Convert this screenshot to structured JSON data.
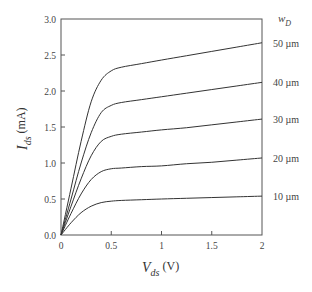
{
  "chart_data": {
    "type": "line",
    "title": "",
    "xlabel": "V_ds (V)",
    "ylabel": "I_ds (mA)",
    "xlabel_main": "V",
    "xlabel_sub": "ds",
    "xlabel_unit": "(V)",
    "ylabel_main": "I",
    "ylabel_sub": "ds",
    "ylabel_unit": "(mA)",
    "xlim": [
      0,
      2
    ],
    "ylim": [
      0,
      3.0
    ],
    "xticks": [
      "0",
      "0.5",
      "1",
      "1.5",
      "2"
    ],
    "yticks": [
      "0.0",
      "0.5",
      "1.0",
      "1.5",
      "2.0",
      "2.5",
      "3.0"
    ],
    "grid": false,
    "legend_title_main": "w",
    "legend_title_sub": "D",
    "legend_position": "right",
    "x": [
      0,
      0.1,
      0.2,
      0.3,
      0.4,
      0.5,
      0.6,
      0.8,
      1.0,
      1.25,
      1.5,
      1.75,
      2.0
    ],
    "series": [
      {
        "name": "10 µm",
        "label": "10 µm",
        "values": [
          0,
          0.17,
          0.31,
          0.4,
          0.45,
          0.47,
          0.48,
          0.49,
          0.5,
          0.51,
          0.52,
          0.53,
          0.54
        ]
      },
      {
        "name": "20 µm",
        "label": "20 µm",
        "values": [
          0,
          0.3,
          0.57,
          0.77,
          0.88,
          0.92,
          0.93,
          0.95,
          0.96,
          0.99,
          1.01,
          1.04,
          1.07
        ]
      },
      {
        "name": "30 µm",
        "label": "30 µm",
        "values": [
          0,
          0.4,
          0.78,
          1.1,
          1.3,
          1.37,
          1.4,
          1.43,
          1.46,
          1.49,
          1.53,
          1.57,
          1.61
        ]
      },
      {
        "name": "40 µm",
        "label": "40 µm",
        "values": [
          0,
          0.5,
          1.0,
          1.42,
          1.7,
          1.8,
          1.84,
          1.88,
          1.92,
          1.97,
          2.02,
          2.07,
          2.12
        ]
      },
      {
        "name": "50 µm",
        "label": "50 µm",
        "values": [
          0,
          0.65,
          1.3,
          1.85,
          2.15,
          2.28,
          2.33,
          2.38,
          2.43,
          2.49,
          2.55,
          2.61,
          2.67
        ]
      }
    ]
  }
}
